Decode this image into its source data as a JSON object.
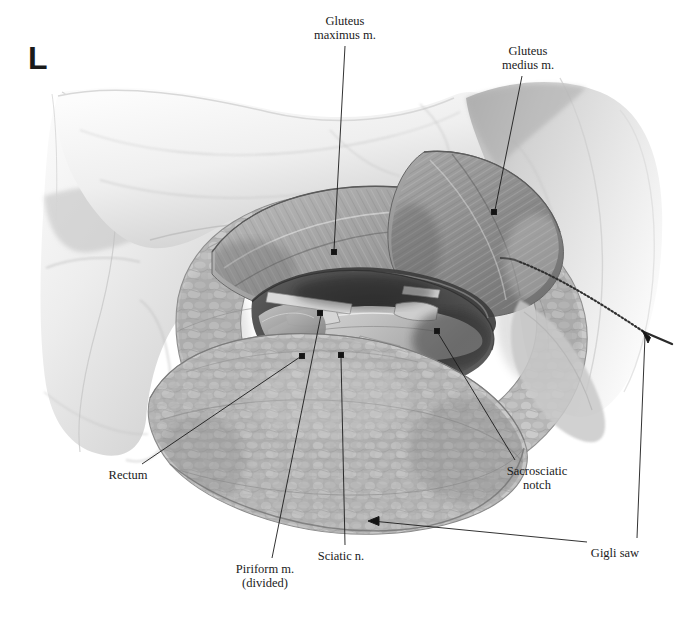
{
  "figure": {
    "orientation_marker": "L",
    "background_color": "#ffffff",
    "ink_color": "#1b1b1b",
    "style": "grayscale medical illustration"
  },
  "annotations": [
    {
      "id": "gluteus-maximus",
      "label": "Gluteus\nmaximus m.",
      "text_x": 345,
      "text_y": 14,
      "align": "center",
      "leader": {
        "x1": 345,
        "y1": 46,
        "x2": 334,
        "y2": 250
      },
      "marker": {
        "x": 334,
        "y": 252,
        "type": "dot"
      }
    },
    {
      "id": "gluteus-medius",
      "label": "Gluteus\nmedius m.",
      "text_x": 528,
      "text_y": 44,
      "align": "center",
      "leader": {
        "x1": 522,
        "y1": 76,
        "x2": 495,
        "y2": 210
      },
      "marker": {
        "x": 494,
        "y": 212,
        "type": "dot"
      }
    },
    {
      "id": "rectum",
      "label": "Rectum",
      "text_x": 128,
      "text_y": 468,
      "align": "center",
      "leader": {
        "x1": 142,
        "y1": 464,
        "x2": 300,
        "y2": 357
      },
      "marker": {
        "x": 302,
        "y": 356,
        "type": "dot"
      }
    },
    {
      "id": "piriform-muscle",
      "label": "Piriform m.\n(divided)",
      "text_x": 265,
      "text_y": 562,
      "align": "center",
      "leader": {
        "x1": 272,
        "y1": 558,
        "x2": 321,
        "y2": 315
      },
      "marker": {
        "x": 320,
        "y": 313,
        "type": "dot"
      }
    },
    {
      "id": "sciatic-nerve",
      "label": "Sciatic n.",
      "text_x": 341,
      "text_y": 549,
      "align": "center",
      "leader": {
        "x1": 345,
        "y1": 545,
        "x2": 341,
        "y2": 357
      },
      "marker": {
        "x": 341,
        "y": 355,
        "type": "dot"
      }
    },
    {
      "id": "sacrosciatic-notch",
      "label": "Sacrosciatic\nnotch",
      "text_x": 537,
      "text_y": 464,
      "align": "center",
      "leader": {
        "x1": 515,
        "y1": 460,
        "x2": 438,
        "y2": 333
      },
      "marker": {
        "x": 437,
        "y": 331,
        "type": "dot"
      }
    },
    {
      "id": "gigli-saw",
      "label": "Gigli saw",
      "text_x": 615,
      "text_y": 546,
      "align": "center",
      "leader": {
        "x1": 587,
        "y1": 542,
        "x2": 372,
        "y2": 521
      },
      "marker": {
        "x": 368,
        "y": 521,
        "type": "arrow-left"
      },
      "leader2": {
        "x1": 637,
        "y1": 538,
        "x2": 645,
        "y2": 336
      },
      "marker2": {
        "x": 642,
        "y": 330,
        "type": "arrow-up-left"
      }
    }
  ],
  "leader_markers": {
    "dot_size": 5,
    "line_width": 0.9
  }
}
